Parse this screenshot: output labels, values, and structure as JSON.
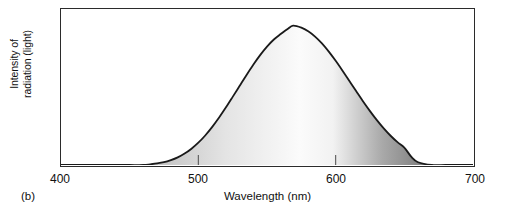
{
  "figure": {
    "panel_letter": "(b)",
    "background_color": "#ffffff",
    "frame_color": "#2b2b2b"
  },
  "axes": {
    "x_title": "Wavelength (nm)",
    "y_title_line1": "Intensity of",
    "y_title_line2": "radiation (light)",
    "x_ticks": [
      "400",
      "500",
      "600",
      "700"
    ]
  },
  "chart_data": {
    "type": "area",
    "title": "",
    "subtitle": "",
    "xlabel": "Wavelength (nm)",
    "ylabel": "Intensity of radiation (light)",
    "xlim": [
      400,
      700
    ],
    "ylim": [
      0,
      1.12
    ],
    "grid": false,
    "legend": null,
    "tick_labels_x": [
      "400",
      "500",
      "600",
      "700"
    ],
    "tick_labels_y": [],
    "annotations": [
      "(b)"
    ],
    "curve_description": "Broad bell-shaped (gaussian) emission spectrum peaking near 569 nm, spanning roughly 480-655 nm, filled with a grayscale gradient that is mid-gray at the left edge, brightest (white) just right of the peak near 580-600 nm, and darkest gray at the right tail.",
    "series": [
      {
        "name": "Intensity of radiation",
        "peak_x": 569,
        "peak_y": 1.0,
        "sigma": 33,
        "x": [
          400,
          410,
          420,
          430,
          440,
          450,
          460,
          465,
          470,
          475,
          480,
          485,
          490,
          495,
          500,
          505,
          510,
          515,
          520,
          525,
          530,
          535,
          540,
          545,
          550,
          555,
          560,
          565,
          569,
          575,
          580,
          585,
          590,
          595,
          600,
          605,
          610,
          615,
          620,
          625,
          630,
          635,
          640,
          645,
          650,
          655,
          660,
          670,
          680,
          690,
          700
        ],
        "y": [
          0.0,
          0.0,
          0.0,
          0.0,
          0.0,
          0.0,
          0.0,
          0.005,
          0.011,
          0.02,
          0.035,
          0.055,
          0.082,
          0.117,
          0.16,
          0.212,
          0.272,
          0.339,
          0.412,
          0.489,
          0.567,
          0.645,
          0.72,
          0.789,
          0.85,
          0.901,
          0.94,
          0.977,
          1.0,
          0.986,
          0.96,
          0.922,
          0.873,
          0.814,
          0.748,
          0.677,
          0.603,
          0.529,
          0.456,
          0.387,
          0.322,
          0.263,
          0.21,
          0.164,
          0.125,
          0.06,
          0.02,
          0.0,
          0.0,
          0.0,
          0.0
        ]
      }
    ],
    "fill_gradient_stops": [
      {
        "position": 0.0,
        "color": "#9a9a9a"
      },
      {
        "position": 0.18,
        "color": "#b8b8b8"
      },
      {
        "position": 0.4,
        "color": "#e4e4e4"
      },
      {
        "position": 0.58,
        "color": "#fbfbfb"
      },
      {
        "position": 0.66,
        "color": "#f2f2f2"
      },
      {
        "position": 0.78,
        "color": "#a9a9a9"
      },
      {
        "position": 0.88,
        "color": "#7e7e7e"
      },
      {
        "position": 1.0,
        "color": "#6f6f6f"
      }
    ],
    "curve_line_color": "#1a1a1a"
  }
}
